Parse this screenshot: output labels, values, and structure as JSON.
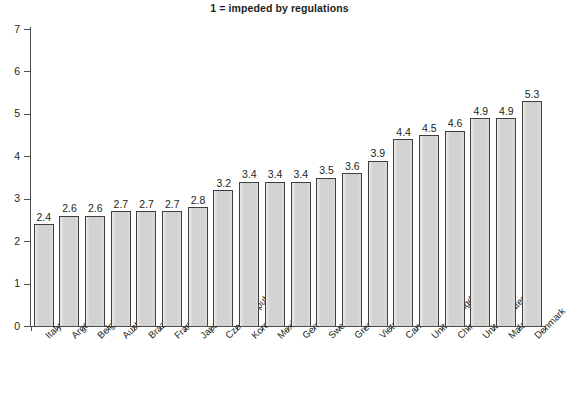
{
  "chart_data": {
    "type": "bar",
    "title": "1 = impeded by regulations",
    "xlabel": "",
    "ylabel": "",
    "ylim": [
      0,
      7
    ],
    "yticks": [
      0,
      1,
      2,
      3,
      4,
      5,
      6,
      7
    ],
    "grid": false,
    "legend": null,
    "bar_color": "#d2d2d2",
    "bar_edge_color": "#3f3f3f",
    "axis_color": "#4d4d4d",
    "text_color": "#231f20",
    "value_labels_shown": true,
    "categories": [
      "Italy",
      "Argentina",
      "Belgium",
      "Australia",
      "Brazil",
      "France",
      "Japan",
      "Czech Republic",
      "Korea",
      "Mexico",
      "Germany",
      "Sweden",
      "Greece",
      "Vietnam",
      "Canada",
      "United Kingdom",
      "China",
      "United States",
      "Malaysia",
      "Denmark"
    ],
    "values": [
      2.4,
      2.6,
      2.6,
      2.7,
      2.7,
      2.7,
      2.8,
      3.2,
      3.4,
      3.4,
      3.4,
      3.5,
      3.6,
      3.9,
      4.4,
      4.5,
      4.6,
      4.9,
      4.9,
      5.3
    ],
    "value_labels": [
      "2.4",
      "2.6",
      "2.6",
      "2.7",
      "2.7",
      "2.7",
      "2.8",
      "3.2",
      "3.4",
      "3.4",
      "3.4",
      "3.5",
      "3.6",
      "3.9",
      "4.4",
      "4.5",
      "4.6",
      "4.9",
      "4.9",
      "5.3"
    ],
    "ytick_labels": [
      "0",
      "1",
      "2",
      "3",
      "4",
      "5",
      "6",
      "7"
    ]
  }
}
